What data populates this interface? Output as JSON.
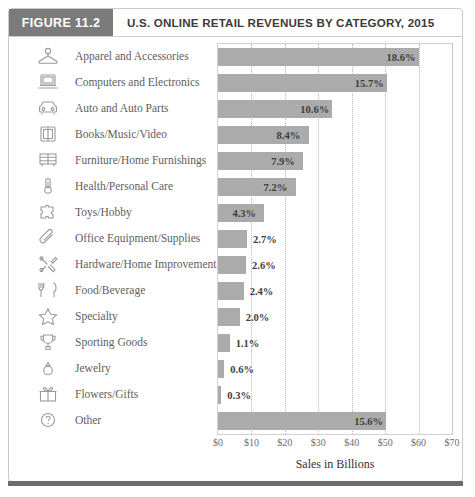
{
  "figure": {
    "badge": "FIGURE 11.2",
    "title": "U.S. ONLINE RETAIL REVENUES BY CATEGORY, 2015"
  },
  "chart_data": {
    "type": "bar",
    "orientation": "horizontal",
    "title": "U.S. ONLINE RETAIL REVENUES BY CATEGORY, 2015",
    "xlabel": "Sales in Billions",
    "ylabel": "",
    "xlim": [
      0,
      70
    ],
    "xticks": [
      0,
      10,
      20,
      30,
      40,
      50,
      60,
      70
    ],
    "xtick_labels": [
      "$0",
      "$10",
      "$20",
      "$30",
      "$40",
      "$50",
      "$60",
      "$70"
    ],
    "grid": "vertical-dotted",
    "legend": "none",
    "value_unit": "percent-share",
    "bar_color": "#ababab",
    "categories": [
      "Apparel and Accessories",
      "Computers and Electronics",
      "Auto and Auto Parts",
      "Books/Music/Video",
      "Furniture/Home Furnishings",
      "Health/Personal Care",
      "Toys/Hobby",
      "Office Equipment/Supplies",
      "Hardware/Home Improvement",
      "Food/Beverage",
      "Specialty",
      "Sporting Goods",
      "Jewelry",
      "Flowers/Gifts",
      "Other"
    ],
    "icons": [
      "hanger-icon",
      "laptop-icon",
      "car-icon",
      "book-icon",
      "furniture-icon",
      "thermometer-icon",
      "puzzle-icon",
      "paperclip-icon",
      "tools-icon",
      "utensils-icon",
      "star-icon",
      "trophy-icon",
      "ring-icon",
      "gift-icon",
      "question-icon"
    ],
    "values": [
      18.6,
      15.7,
      10.6,
      8.4,
      7.9,
      7.2,
      4.3,
      2.7,
      2.6,
      2.4,
      2.0,
      1.1,
      0.6,
      0.3,
      15.6
    ],
    "data_labels": [
      "18.6%",
      "15.7%",
      "10.6%",
      "8.4%",
      "7.9%",
      "7.2%",
      "4.3%",
      "2.7%",
      "2.6%",
      "2.4%",
      "2.0%",
      "1.1%",
      "0.6%",
      "0.3%",
      "15.6%"
    ],
    "bar_lengths_billions": [
      60.0,
      50.5,
      34.2,
      27.1,
      25.5,
      23.2,
      13.9,
      8.7,
      8.4,
      7.7,
      6.5,
      3.5,
      1.9,
      1.0,
      50.3
    ]
  }
}
